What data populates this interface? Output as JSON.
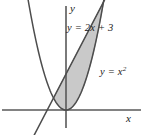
{
  "figure": {
    "kind": "math-graph",
    "background_color": "#ffffff",
    "curve_color": "#4d4d4d",
    "axis_color": "#595959",
    "shade_color": "#c9c9c9",
    "shade_edge_color": "#8c8c8c",
    "text_color": "#1a1a1a"
  },
  "axes": {
    "x_label": "x",
    "y_label": "y",
    "origin_px": [
      66,
      110
    ],
    "x_units_per_px": 12.5,
    "y_units_per_px": 12.0,
    "xlim": [
      -5.3,
      6.2
    ],
    "ylim": [
      -2.1,
      9.2
    ],
    "grid": false,
    "ticks": []
  },
  "labels": {
    "line": "y = 2x + 3",
    "parabola_prefix": "y = x",
    "parabola_exponent": "2"
  },
  "chart_data": {
    "type": "line",
    "title": "",
    "xlabel": "x",
    "ylabel": "y",
    "xlim": [
      -5.3,
      6.2
    ],
    "ylim": [
      -2.1,
      9.2
    ],
    "grid": false,
    "legend": "inline-annotations",
    "series": [
      {
        "name": "y = 2x + 3",
        "equation": "y = 2x + 3",
        "type": "line",
        "slope": 2,
        "intercept": 3,
        "annotation": "y = 2x + 3",
        "x": [
          -4.5,
          -1,
          0,
          3,
          4.6
        ],
        "values": [
          -6,
          1,
          3,
          9,
          12.2
        ]
      },
      {
        "name": "y = x^2",
        "equation": "y = x²",
        "type": "parabola",
        "vertex": [
          0,
          0
        ],
        "annotation": "y = x²",
        "x": [
          -3,
          -2,
          -1,
          0,
          1,
          2,
          3,
          3.4
        ],
        "values": [
          9,
          4,
          1,
          0,
          1,
          4,
          9,
          11.56
        ]
      }
    ],
    "shaded_region": {
      "description": "Region between the line y = 2x + 3 and the parabola y = x²",
      "upper_boundary": "y = 2x + 3",
      "lower_boundary": "y = x²",
      "x_from": -1,
      "x_to": 3,
      "intersections": [
        [
          -1,
          1
        ],
        [
          3,
          9
        ]
      ],
      "fill": "#c9c9c9"
    }
  }
}
